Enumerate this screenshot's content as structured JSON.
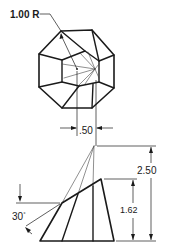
{
  "figure": {
    "type": "orthographic technical drawing",
    "views": [
      "top view (octagonal)",
      "front view (truncated pyramid section)"
    ],
    "line_color": "#1a1a1a",
    "background": "#ffffff"
  },
  "dimensions": {
    "radius": {
      "label": "1.00 R",
      "value": 1.0,
      "unit": "R"
    },
    "offset_width": {
      "label": ".50",
      "value": 0.5
    },
    "total_height": {
      "label": "2.50",
      "value": 2.5
    },
    "cut_height": {
      "label": "1.62",
      "value": 1.62
    },
    "cut_angle": {
      "label": "30",
      "degree_symbol": "°",
      "value": 30
    }
  }
}
